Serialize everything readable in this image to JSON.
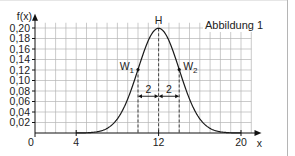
{
  "chart_data": {
    "type": "line",
    "title": "Abbildung 1",
    "xlabel": "x",
    "ylabel": "f(x)",
    "xlim": [
      0,
      21
    ],
    "ylim": [
      0,
      0.21
    ],
    "grid": true,
    "x_ticks": [
      {
        "value": 0,
        "label": "0"
      },
      {
        "value": 4,
        "label": "4"
      },
      {
        "value": 12,
        "label": "12"
      },
      {
        "value": 20,
        "label": "20"
      }
    ],
    "y_ticks": [
      {
        "value": 0.02,
        "label": "0,02"
      },
      {
        "value": 0.04,
        "label": "0,04"
      },
      {
        "value": 0.06,
        "label": "0,06"
      },
      {
        "value": 0.08,
        "label": "0,08"
      },
      {
        "value": 0.1,
        "label": "0,10"
      },
      {
        "value": 0.12,
        "label": "0,12"
      },
      {
        "value": 0.14,
        "label": "0,14"
      },
      {
        "value": 0.16,
        "label": "0,16"
      },
      {
        "value": 0.18,
        "label": "0,18"
      },
      {
        "value": 0.2,
        "label": "0,20"
      }
    ],
    "series": [
      {
        "name": "f(x) normal density",
        "mu": 12,
        "sigma": 2,
        "x": [
          4,
          5,
          6,
          7,
          8,
          9,
          10,
          11,
          12,
          13,
          14,
          15,
          16,
          17,
          18,
          19,
          20
        ],
        "values": [
          0.0001,
          0.0009,
          0.0044,
          0.0175,
          0.054,
          0.1295,
          0.121,
          0.176,
          0.1995,
          0.176,
          0.121,
          0.0648,
          0.027,
          0.0088,
          0.0022,
          0.0004,
          0.0001
        ]
      }
    ],
    "annotations": [
      {
        "label": "H",
        "x": 12,
        "y": 0.1995,
        "type": "maximum"
      },
      {
        "label": "W",
        "sub": "1",
        "x": 10,
        "y": 0.121,
        "type": "inflection"
      },
      {
        "label": "W",
        "sub": "2",
        "x": 14,
        "y": 0.121,
        "type": "inflection"
      },
      {
        "label": "2",
        "from": 10,
        "to": 12,
        "y": 0.07,
        "type": "distance"
      },
      {
        "label": "2",
        "from": 12,
        "to": 14,
        "y": 0.07,
        "type": "distance"
      }
    ],
    "dashed_lines_x": [
      10,
      12,
      14
    ],
    "colors": {
      "curve": "#1a1a1a",
      "grid": "#b4b4b4",
      "axis": "#111111"
    }
  }
}
